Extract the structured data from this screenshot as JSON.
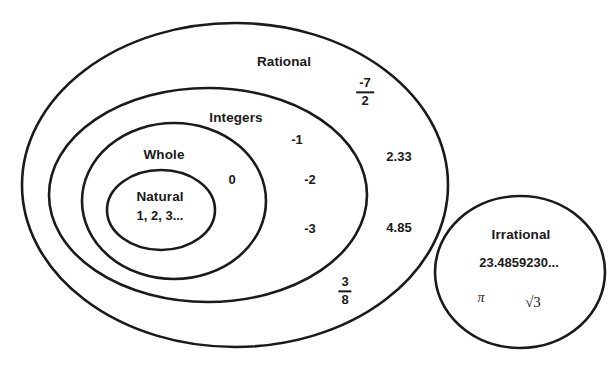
{
  "diagram": {
    "stroke_color": "#1a1a1a",
    "background_color": "#ffffff",
    "sets": [
      {
        "id": "rational",
        "label": "Rational",
        "shape": "ellipse",
        "label_x": 284,
        "label_y": 62,
        "cx": 235,
        "cy": 185,
        "rx": 213,
        "ry": 162
      },
      {
        "id": "integers",
        "label": "Integers",
        "shape": "ellipse",
        "label_x": 236,
        "label_y": 118,
        "cx": 208,
        "cy": 195,
        "rx": 159,
        "ry": 107
      },
      {
        "id": "whole",
        "label": "Whole",
        "shape": "ellipse",
        "label_x": 164,
        "label_y": 155,
        "cx": 174,
        "cy": 201,
        "rx": 92,
        "ry": 78
      },
      {
        "id": "natural",
        "label": "Natural",
        "shape": "ellipse",
        "label_x": 160,
        "label_y": 197,
        "cx": 161,
        "cy": 210,
        "rx": 54,
        "ry": 40
      },
      {
        "id": "irrational",
        "label": "Irrational",
        "shape": "circle",
        "label_x": 521,
        "label_y": 235,
        "cx": 520,
        "cy": 272,
        "rx": 85,
        "ry": 76
      }
    ],
    "members": [
      {
        "id": "natural-members",
        "text": "1, 2, 3...",
        "set": "natural",
        "x": 160,
        "y": 216,
        "style": "member"
      },
      {
        "id": "zero",
        "text": "0",
        "set": "whole",
        "x": 232,
        "y": 180,
        "style": "member"
      },
      {
        "id": "neg-one",
        "text": "-1",
        "set": "integers",
        "x": 297,
        "y": 140,
        "style": "member"
      },
      {
        "id": "neg-two",
        "text": "-2",
        "set": "integers",
        "x": 310,
        "y": 180,
        "style": "member"
      },
      {
        "id": "neg-three",
        "text": "-3",
        "set": "integers",
        "x": 310,
        "y": 229,
        "style": "member"
      },
      {
        "id": "two-point-three-three",
        "text": "2.33",
        "set": "rational",
        "x": 399,
        "y": 157,
        "style": "member"
      },
      {
        "id": "four-point-eight-five",
        "text": "4.85",
        "set": "rational",
        "x": 399,
        "y": 228,
        "style": "member"
      },
      {
        "id": "irrational-decimal",
        "text": "23.4859230...",
        "set": "irrational",
        "x": 519,
        "y": 263,
        "style": "member"
      },
      {
        "id": "pi",
        "text": "π",
        "set": "irrational",
        "x": 481,
        "y": 298,
        "style": "member-light"
      },
      {
        "id": "sqrt-three",
        "text": "√3",
        "set": "irrational",
        "x": 533,
        "y": 302,
        "style": "member-radical"
      }
    ],
    "fractions": [
      {
        "id": "neg-seven-halves",
        "numerator": "-7",
        "denominator": "2",
        "set": "rational",
        "x": 365,
        "y": 92
      },
      {
        "id": "three-eighths",
        "numerator": "3",
        "denominator": "8",
        "set": "rational",
        "x": 345,
        "y": 291
      }
    ]
  }
}
